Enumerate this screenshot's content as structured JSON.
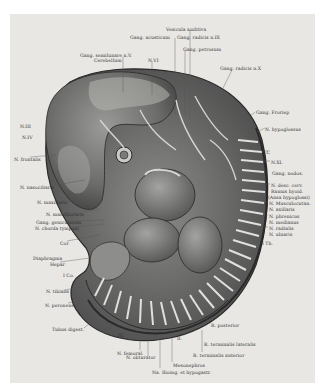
{
  "figure": {
    "background_color": "#e9e7e3",
    "labels_top": [
      {
        "id": "vesicula-auditiva",
        "text": "Vesicula auditiva",
        "x": 166,
        "y": 27
      },
      {
        "id": "gang-acusticum",
        "text": "Gang. acusticum",
        "x": 130,
        "y": 35
      },
      {
        "id": "gang-radicis-ix",
        "text": "Gang. radicis n.IX",
        "x": 177,
        "y": 35
      },
      {
        "id": "gang-petrosum",
        "text": "Gang. petrosum",
        "x": 183,
        "y": 47
      },
      {
        "id": "gang-semilunare",
        "text": "Gang. semilunare n.V.",
        "x": 80,
        "y": 53
      },
      {
        "id": "cerebellum",
        "text": "Cerebellum",
        "x": 94,
        "y": 58
      },
      {
        "id": "n-vi",
        "text": "N.VI",
        "x": 148,
        "y": 58
      },
      {
        "id": "gang-radicis-x",
        "text": "Gang. radicis n.X",
        "x": 220,
        "y": 66
      }
    ],
    "labels_left": [
      {
        "id": "n-iii",
        "text": "N.III",
        "x": 20,
        "y": 124
      },
      {
        "id": "n-iv",
        "text": "N.IV",
        "x": 22,
        "y": 135
      },
      {
        "id": "n-frontalis",
        "text": "N. frontalis",
        "x": 14,
        "y": 157
      },
      {
        "id": "n-nasociliaris",
        "text": "N. nasociliaris",
        "x": 20,
        "y": 185
      },
      {
        "id": "n-maxillaris",
        "text": "N. maxillaris",
        "x": 37,
        "y": 200
      },
      {
        "id": "n-mandibularis",
        "text": "N. mandibularis",
        "x": 46,
        "y": 212
      },
      {
        "id": "gang-geniculatum",
        "text": "Gang. geniculatum",
        "x": 36,
        "y": 220
      },
      {
        "id": "n-chorda-tympani",
        "text": "N. chorda tympani",
        "x": 35,
        "y": 226
      },
      {
        "id": "cor",
        "text": "Cor",
        "x": 60,
        "y": 241
      },
      {
        "id": "diaphragma",
        "text": "Diaphragma",
        "x": 33,
        "y": 256
      },
      {
        "id": "hepar",
        "text": "Hepar",
        "x": 50,
        "y": 262
      },
      {
        "id": "1-co",
        "text": "I Co.",
        "x": 63,
        "y": 273
      },
      {
        "id": "n-tibialis",
        "text": "N. tibialis",
        "x": 46,
        "y": 289
      },
      {
        "id": "n-peroneus",
        "text": "N. peroneus",
        "x": 45,
        "y": 303
      },
      {
        "id": "tuba-digest",
        "text": "Tubus digest.",
        "x": 52,
        "y": 327
      }
    ],
    "labels_right": [
      {
        "id": "gang-froriep",
        "text": "Gang. Froriep",
        "x": 256,
        "y": 110
      },
      {
        "id": "n-hypoglossus",
        "text": "N. hypoglossus",
        "x": 265,
        "y": 127
      },
      {
        "id": "1-c",
        "text": "1.C",
        "x": 262,
        "y": 150
      },
      {
        "id": "n-xi",
        "text": "N.XI.",
        "x": 271,
        "y": 160
      },
      {
        "id": "gang-nodos",
        "text": "Gang. nodos.",
        "x": 272,
        "y": 171
      },
      {
        "id": "n-desc-cerv",
        "text": "N. desc. cerv.",
        "x": 271,
        "y": 183
      },
      {
        "id": "ramus-hyoid",
        "text": "Ramus hyoid.",
        "x": 271,
        "y": 189
      },
      {
        "id": "ansa-hypoglossi",
        "text": "(Ansa hypoglossi)",
        "x": 268,
        "y": 195
      },
      {
        "id": "n-musculocutan",
        "text": "N. Musculocutan.",
        "x": 269,
        "y": 201
      },
      {
        "id": "n-axillaris",
        "text": "N. axillaris",
        "x": 269,
        "y": 207
      },
      {
        "id": "n-phrenicus",
        "text": "N. phrenicus",
        "x": 269,
        "y": 214
      },
      {
        "id": "n-medianus",
        "text": "N. medianus",
        "x": 269,
        "y": 220
      },
      {
        "id": "n-radialis",
        "text": "N. radialis",
        "x": 269,
        "y": 226
      },
      {
        "id": "n-ulnaris",
        "text": "N. ulnaris",
        "x": 269,
        "y": 232
      },
      {
        "id": "1-th",
        "text": "I Th.",
        "x": 262,
        "y": 241
      }
    ],
    "labels_bottom": [
      {
        "id": "r-posterior",
        "text": "R. posterior",
        "x": 211,
        "y": 323
      },
      {
        "id": "is",
        "text": "IS.",
        "x": 118,
        "y": 333
      },
      {
        "id": "ii",
        "text": "II.",
        "x": 177,
        "y": 336
      },
      {
        "id": "r-terminalis-lateralis",
        "text": "R. terminalis lateralis",
        "x": 204,
        "y": 342
      },
      {
        "id": "n-femoralis",
        "text": "N. femoral.",
        "x": 117,
        "y": 351
      },
      {
        "id": "r-terminalis-anterior",
        "text": "R. terminalis anterior",
        "x": 193,
        "y": 353
      },
      {
        "id": "n-obturator",
        "text": "N. obturator",
        "x": 126,
        "y": 355
      },
      {
        "id": "mesonephros",
        "text": "Mesonephros",
        "x": 173,
        "y": 363
      },
      {
        "id": "na-iliolng-et-hypogastr",
        "text": "Na. Ilioing. et hypogastr.",
        "x": 152,
        "y": 370
      }
    ]
  }
}
